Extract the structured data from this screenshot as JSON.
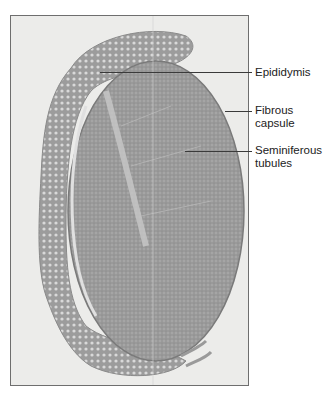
{
  "figure": {
    "colors": {
      "background": "#ffffff",
      "photo_bg": "#ececea",
      "frame": "#6e6e6e",
      "tissue_dark": "#8a8a8a",
      "tissue_mid": "#a3a3a3",
      "tissue_light": "#c4c4c4",
      "leader_line": "#3a3a3a",
      "label_text": "#222222"
    },
    "labels": [
      {
        "text": "Epididymis",
        "y": 66
      },
      {
        "text": "Fibrous\ncapsule",
        "y": 104
      },
      {
        "text": "Seminiferous\ntubules",
        "y": 144
      }
    ]
  }
}
